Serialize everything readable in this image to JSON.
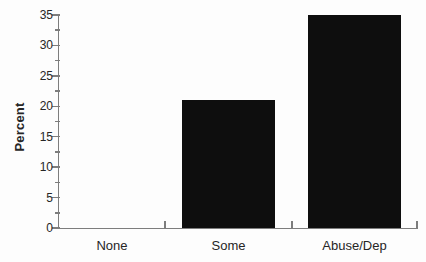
{
  "chart_data": {
    "type": "bar",
    "categories": [
      "None",
      "Some",
      "Abuse/Dep"
    ],
    "values": [
      0,
      21,
      35
    ],
    "title": "",
    "xlabel": "",
    "ylabel": "Percent",
    "ylim": [
      0,
      35
    ],
    "yticks": [
      0,
      5,
      10,
      15,
      20,
      25,
      30,
      35
    ],
    "minor_tick_step": 2.5,
    "grid": false,
    "legend": "none",
    "bar_color": "#0e0e0e",
    "axis_color": "#7d7d7d",
    "label_color": "#262626",
    "background_color": "#fdfdfd"
  }
}
